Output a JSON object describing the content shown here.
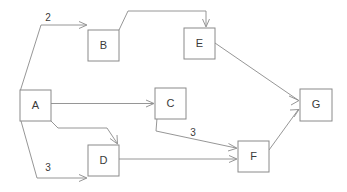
{
  "diagram": {
    "type": "directed-graph",
    "title": "",
    "background_color": "#ffffff",
    "stroke_color": "#8a8a8a",
    "text_color": "#3a3a3a",
    "nodes": [
      {
        "id": "A",
        "label": "A",
        "x": 20,
        "y": 90,
        "w": 31,
        "h": 31
      },
      {
        "id": "B",
        "label": "B",
        "x": 88,
        "y": 30,
        "w": 31,
        "h": 31
      },
      {
        "id": "C",
        "label": "C",
        "x": 155,
        "y": 88,
        "w": 31,
        "h": 31
      },
      {
        "id": "D",
        "label": "D",
        "x": 88,
        "y": 145,
        "w": 31,
        "h": 31
      },
      {
        "id": "E",
        "label": "E",
        "x": 184,
        "y": 28,
        "w": 31,
        "h": 31
      },
      {
        "id": "F",
        "label": "F",
        "x": 238,
        "y": 141,
        "w": 31,
        "h": 31
      },
      {
        "id": "G",
        "label": "G",
        "x": 300,
        "y": 89,
        "w": 32,
        "h": 32
      }
    ],
    "edges": [
      {
        "id": "A-B",
        "from": "A",
        "to": "B",
        "label": "2",
        "label_x": 48,
        "label_y": 18
      },
      {
        "id": "B-E",
        "from": "B",
        "to": "E",
        "label": ""
      },
      {
        "id": "A-C",
        "from": "A",
        "to": "C",
        "label": ""
      },
      {
        "id": "A-D-top",
        "from": "A",
        "to": "D",
        "label": ""
      },
      {
        "id": "A-D-bottom",
        "from": "A",
        "to": "D",
        "label": "3",
        "label_x": 48,
        "label_y": 168
      },
      {
        "id": "C-F",
        "from": "C",
        "to": "F",
        "label": "3",
        "label_x": 193,
        "label_y": 133
      },
      {
        "id": "D-F",
        "from": "D",
        "to": "F",
        "label": ""
      },
      {
        "id": "E-G",
        "from": "E",
        "to": "G",
        "label": ""
      },
      {
        "id": "F-G",
        "from": "F",
        "to": "G",
        "label": ""
      }
    ]
  }
}
